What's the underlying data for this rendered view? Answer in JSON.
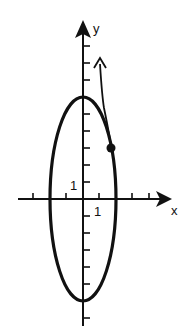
{
  "figure": {
    "type": "coordinate-plane-ellipse",
    "background": "#ffffff",
    "ink_color": "#111111",
    "axes": {
      "x_label": "x",
      "y_label": "y",
      "unit_label_x": "1",
      "unit_label_y": "1",
      "origin_px": [
        83,
        199
      ],
      "unit_px_x": 16.5,
      "unit_px_y": 17,
      "x_ticks": [
        -3,
        -2,
        -1,
        1,
        2,
        3,
        4
      ],
      "y_ticks": [
        -7,
        -6,
        -5,
        -4,
        -3,
        -2,
        -1,
        1,
        2,
        3,
        4,
        5,
        6,
        7,
        8,
        9
      ]
    },
    "ellipse": {
      "center": [
        0,
        0
      ],
      "semi_axis_x": 2,
      "semi_axis_y": 6,
      "equation": "x^2/4 + y^2/36 = 1"
    },
    "point": {
      "approx_xy": [
        1.7,
        3.0
      ],
      "description": "filled dot on ellipse with arrow indicating direction upward along the curve"
    },
    "direction_arrow": {
      "from": "point on ellipse",
      "direction": "counterclockwise, upward"
    }
  }
}
